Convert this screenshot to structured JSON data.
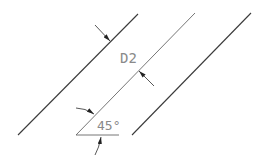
{
  "diagram": {
    "type": "technical-drawing",
    "labels": {
      "dimension": "D2",
      "angle": "45°"
    },
    "colors": {
      "line": "#3a3a3a",
      "thin_line": "#777777",
      "text": "#8a8a8a",
      "background": "#ffffff"
    },
    "lines": [
      {
        "name": "left-parallel-line",
        "x1": 18,
        "y1": 135,
        "x2": 138,
        "y2": 14
      },
      {
        "name": "middle-parallel-line",
        "x1": 76,
        "y1": 135,
        "x2": 195,
        "y2": 13
      },
      {
        "name": "right-parallel-line",
        "x1": 132,
        "y1": 135,
        "x2": 251,
        "y2": 13
      }
    ]
  }
}
